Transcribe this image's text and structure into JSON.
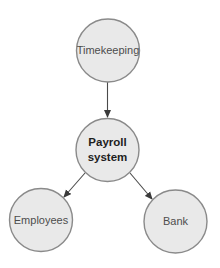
{
  "diagram": {
    "type": "flow",
    "colors": {
      "node_fill": "#e9e9e9",
      "node_stroke": "#8a8a8a",
      "edge": "#4a4a4a",
      "label": "#4d4d4d",
      "label_central": "#1e1e1e"
    },
    "nodes": [
      {
        "id": "timekeeping",
        "label": "Timekeeping"
      },
      {
        "id": "payroll",
        "label_line1": "Payroll",
        "label_line2": "system",
        "central": true
      },
      {
        "id": "employees",
        "label": "Employees"
      },
      {
        "id": "bank",
        "label": "Bank"
      }
    ],
    "edges": [
      {
        "from": "timekeeping",
        "to": "payroll"
      },
      {
        "from": "payroll",
        "to": "employees"
      },
      {
        "from": "payroll",
        "to": "bank"
      }
    ]
  }
}
